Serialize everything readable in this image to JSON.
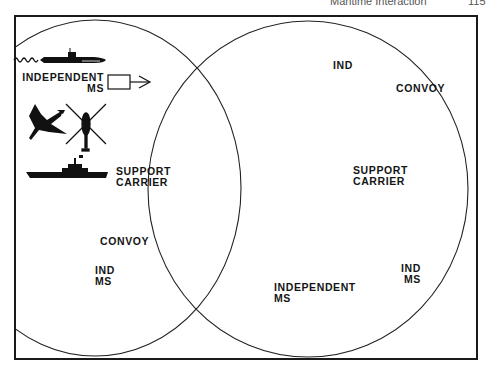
{
  "header": {
    "title": "Maritime Interaction",
    "page": "115"
  },
  "diagram": {
    "type": "venn",
    "left_circle": {
      "items": [
        {
          "icon": "submarine-icon",
          "label": ""
        },
        {
          "icon": "merchant-ship-box-icon",
          "label_line1": "INDEPENDENT",
          "label_line2": "MS",
          "direction": "right"
        },
        {
          "icon": "aircraft-icon",
          "label": ""
        },
        {
          "icon": "helicopter-icon",
          "label": ""
        },
        {
          "icon": "carrier-icon",
          "label_line1": "SUPPORT",
          "label_line2": "CARRIER"
        },
        {
          "icon": "helicopter-icon",
          "label": ""
        },
        {
          "icon": "convoy-arrow-icon",
          "label": "CONVOY",
          "direction": "down-left"
        },
        {
          "icon": "merchant-ship-box-icon",
          "label_line1": "IND",
          "label_line2": "MS",
          "direction": "left"
        },
        {
          "icon": "submarine-icon",
          "label": ""
        }
      ]
    },
    "right_circle": {
      "items": [
        {
          "icon": "aircraft-icon",
          "label": ""
        },
        {
          "icon": "merchant-ship-box-icon",
          "label": "IND",
          "direction": "down-left"
        },
        {
          "icon": "convoy-arrow-icon",
          "label": "CONVOY",
          "direction": "right"
        },
        {
          "icon": "helicopter-icon",
          "label": ""
        },
        {
          "icon": "carrier-icon",
          "label_line1": "SUPPORT",
          "label_line2": "CARRIER"
        },
        {
          "icon": "helicopter-icon",
          "label": ""
        },
        {
          "icon": "submarine-icon",
          "label": ""
        },
        {
          "icon": "merchant-ship-box-icon",
          "label_line1": "INDEPENDENT",
          "label_line2": "MS",
          "direction": "left"
        },
        {
          "icon": "merchant-ship-box-icon",
          "label_line1": "IND",
          "label_line2": "MS",
          "direction": "down-right"
        }
      ]
    }
  }
}
